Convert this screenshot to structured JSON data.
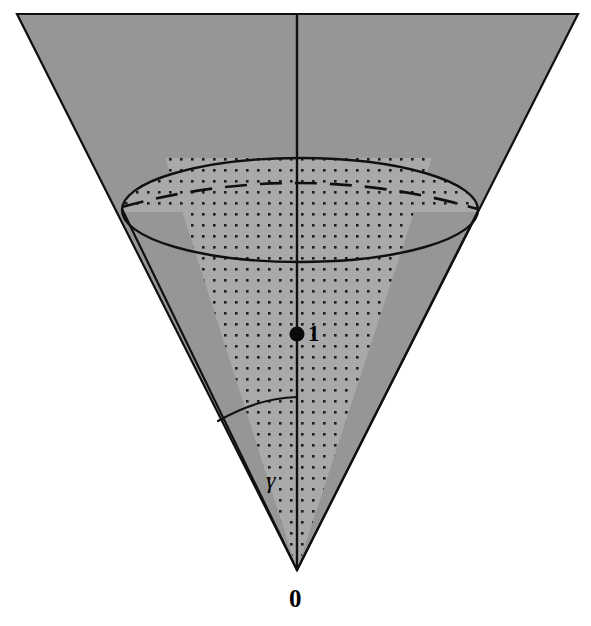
{
  "figure": {
    "kind": "geometry-diagram",
    "canvas": {
      "width": 591,
      "height": 626,
      "background": "#ffffff"
    },
    "colors": {
      "background": "#ffffff",
      "outer_cone_fill": "#969696",
      "inner_cone_fill": "#a9a9a9",
      "dot_pattern": "#1e1e1e",
      "stroke": "#101010",
      "label": "#000000"
    },
    "labels": [
      {
        "id": "apex-label",
        "name": "origin-label",
        "text": "0",
        "role": "apex of the cone / origin point",
        "x": 297,
        "y": 598,
        "style": "bold"
      },
      {
        "id": "point-label",
        "name": "unit-point-label",
        "text": "1",
        "role": "marked point on the cone axis at height 1",
        "x": 312,
        "y": 334,
        "style": "bold"
      },
      {
        "id": "angle-label",
        "name": "gamma-angle-label",
        "text": "γ",
        "role": "half-aperture angle of the inner dotted cone, measured from the axis",
        "x": 274,
        "y": 480,
        "style": "italic"
      }
    ],
    "geometry": {
      "apex": {
        "x": 297,
        "y": 570
      },
      "axis": {
        "x": 297,
        "y_top": 14,
        "y_bottom": 570
      },
      "marked_point": {
        "x": 297,
        "y": 334,
        "radius": 7
      },
      "outer_cone": {
        "top_left": {
          "x": 17,
          "y": 14
        },
        "top_right": {
          "x": 578,
          "y": 14
        },
        "half_angle_deg": 26.7
      },
      "inner_cone": {
        "half_angle_deg": 18.0,
        "edge_left_at_ellipse": {
          "x": 122,
          "y": 210
        },
        "edge_right_at_ellipse": {
          "x": 478,
          "y": 212
        }
      },
      "ellipse": {
        "center": {
          "x": 300,
          "y": 210
        },
        "rx": 178,
        "ry": 52,
        "solid_outline": true,
        "dashed_back_arc": true,
        "dashed_arc_sagitta_y": 190
      },
      "angle_arc": {
        "from": {
          "x": 218,
          "y": 421
        },
        "to": {
          "x": 297,
          "y": 397
        },
        "radius": 175
      }
    }
  }
}
